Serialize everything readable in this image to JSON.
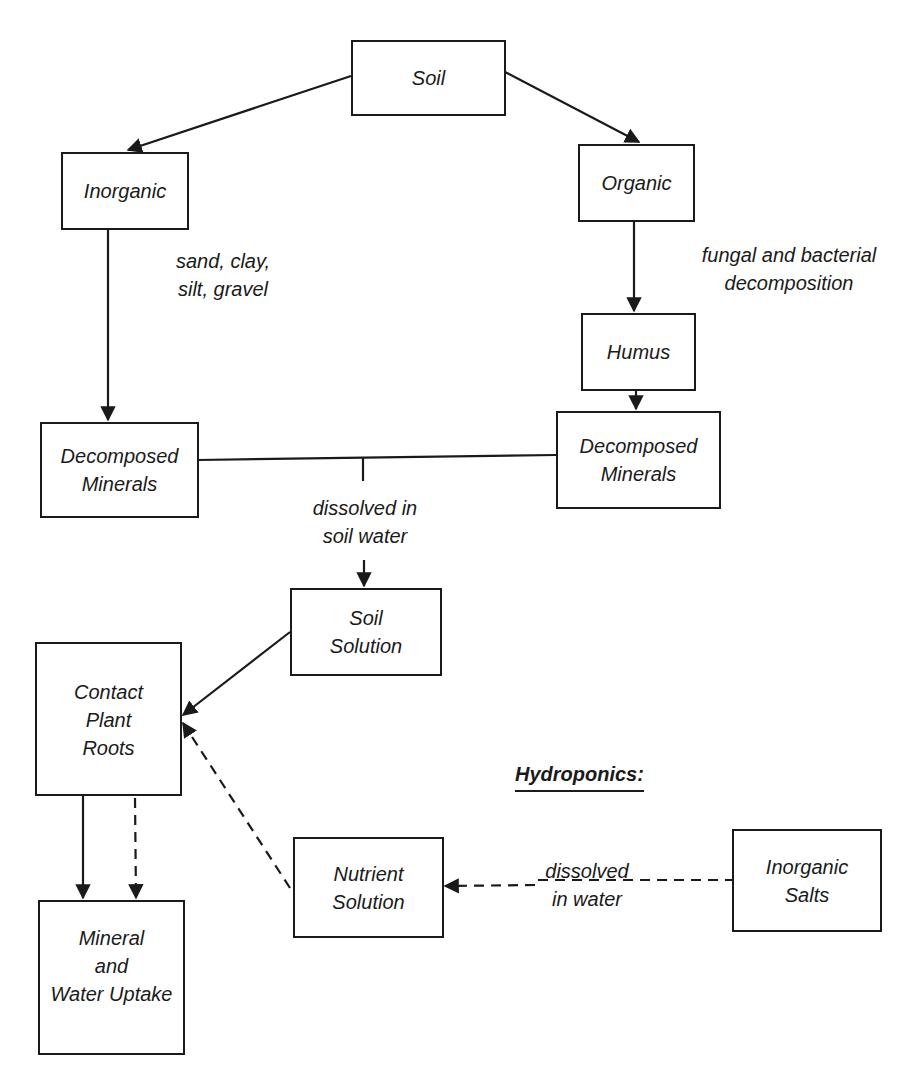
{
  "nodes": {
    "soil": "Soil",
    "inorganic": "Inorganic",
    "organic": "Organic",
    "humus": "Humus",
    "decomposed_left": "Decomposed\nMinerals",
    "decomposed_right": "Decomposed\nMinerals",
    "soil_solution": "Soil\nSolution",
    "contact_roots": "Contact\nPlant\nRoots",
    "uptake": "Mineral\nand\nWater Uptake",
    "nutrient_solution": "Nutrient\nSolution",
    "inorganic_salts": "Inorganic\nSalts"
  },
  "edge_labels": {
    "inorganic_examples": "sand, clay,\nsilt, gravel",
    "organic_process": "fungal and bacterial\ndecomposition",
    "dissolved_soil": "dissolved in\nsoil water",
    "dissolved_water": "dissolved\nin water"
  },
  "section_heading": "Hydroponics:",
  "colors": {
    "ink": "#1a1a1a",
    "background": "#ffffff"
  }
}
